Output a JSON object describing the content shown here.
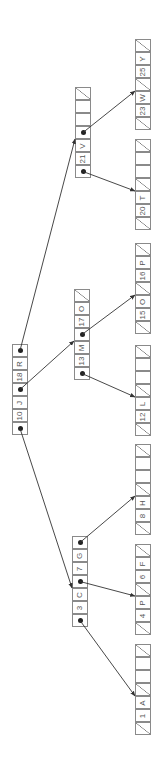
{
  "diagram": {
    "title": "",
    "type": "b-tree",
    "orientation": "rotated-90-ccw",
    "colors": {
      "line": "#8a8a8a",
      "text": "#555555",
      "arrow": "#333333"
    },
    "nodes": [
      {
        "id": "root",
        "x": 12,
        "y_bottom": 435,
        "cells": [
          {
            "kind": "ptr",
            "to": "n_left"
          },
          {
            "kind": "key",
            "text": "10"
          },
          {
            "kind": "key",
            "text": "J"
          },
          {
            "kind": "ptr",
            "to": "n_mid"
          },
          {
            "kind": "key",
            "text": "18"
          },
          {
            "kind": "key",
            "text": "R"
          },
          {
            "kind": "ptr",
            "to": "n_right"
          }
        ]
      },
      {
        "id": "n_left",
        "x": 72,
        "y_bottom": 627,
        "cells": [
          {
            "kind": "ptr",
            "to": "leaf1"
          },
          {
            "kind": "key",
            "text": "3"
          },
          {
            "kind": "key",
            "text": "C"
          },
          {
            "kind": "ptr",
            "to": "leaf2"
          },
          {
            "kind": "key",
            "text": "7"
          },
          {
            "kind": "key",
            "text": "G"
          },
          {
            "kind": "ptr",
            "to": "leaf3"
          }
        ]
      },
      {
        "id": "n_mid",
        "x": 74,
        "y_bottom": 380,
        "cells": [
          {
            "kind": "ptr",
            "to": "leaf4"
          },
          {
            "kind": "key",
            "text": "13"
          },
          {
            "kind": "key",
            "text": "M"
          },
          {
            "kind": "ptr",
            "to": "leaf5"
          },
          {
            "kind": "key",
            "text": "17"
          },
          {
            "kind": "key",
            "text": "O"
          },
          {
            "kind": "nil"
          }
        ]
      },
      {
        "id": "n_right",
        "x": 75,
        "y_bottom": 178,
        "cells": [
          {
            "kind": "ptr",
            "to": "leaf6"
          },
          {
            "kind": "key",
            "text": "21"
          },
          {
            "kind": "key",
            "text": "V"
          },
          {
            "kind": "ptr",
            "to": "leaf7"
          },
          {
            "kind": "empty"
          },
          {
            "kind": "empty"
          },
          {
            "kind": "nil"
          }
        ]
      },
      {
        "id": "leaf1",
        "x": 135,
        "y_bottom": 735,
        "cells": [
          {
            "kind": "nil"
          },
          {
            "kind": "key",
            "text": "1"
          },
          {
            "kind": "key",
            "text": "A"
          },
          {
            "kind": "nil"
          },
          {
            "kind": "empty"
          },
          {
            "kind": "empty"
          },
          {
            "kind": "nil"
          }
        ]
      },
      {
        "id": "leaf2",
        "x": 135,
        "y_bottom": 635,
        "cells": [
          {
            "kind": "nil"
          },
          {
            "kind": "key",
            "text": "4"
          },
          {
            "kind": "key",
            "text": "P"
          },
          {
            "kind": "nil"
          },
          {
            "kind": "key",
            "text": "6"
          },
          {
            "kind": "key",
            "text": "F"
          },
          {
            "kind": "nil"
          }
        ]
      },
      {
        "id": "leaf3",
        "x": 135,
        "y_bottom": 535,
        "cells": [
          {
            "kind": "nil"
          },
          {
            "kind": "key",
            "text": "8"
          },
          {
            "kind": "key",
            "text": "H"
          },
          {
            "kind": "nil"
          },
          {
            "kind": "empty"
          },
          {
            "kind": "empty"
          },
          {
            "kind": "nil"
          }
        ]
      },
      {
        "id": "leaf4",
        "x": 135,
        "y_bottom": 436,
        "cells": [
          {
            "kind": "nil"
          },
          {
            "kind": "key",
            "text": "12"
          },
          {
            "kind": "key",
            "text": "L"
          },
          {
            "kind": "nil"
          },
          {
            "kind": "empty"
          },
          {
            "kind": "empty"
          },
          {
            "kind": "nil"
          }
        ]
      },
      {
        "id": "leaf5",
        "x": 135,
        "y_bottom": 334,
        "cells": [
          {
            "kind": "nil"
          },
          {
            "kind": "key",
            "text": "15"
          },
          {
            "kind": "key",
            "text": "O"
          },
          {
            "kind": "nil"
          },
          {
            "kind": "key",
            "text": "16"
          },
          {
            "kind": "key",
            "text": "P"
          },
          {
            "kind": "nil"
          }
        ]
      },
      {
        "id": "leaf6",
        "x": 135,
        "y_bottom": 230,
        "cells": [
          {
            "kind": "nil"
          },
          {
            "kind": "key",
            "text": "20"
          },
          {
            "kind": "key",
            "text": "T"
          },
          {
            "kind": "nil"
          },
          {
            "kind": "empty"
          },
          {
            "kind": "empty"
          },
          {
            "kind": "nil"
          }
        ]
      },
      {
        "id": "leaf7",
        "x": 135,
        "y_bottom": 130,
        "cells": [
          {
            "kind": "nil"
          },
          {
            "kind": "key",
            "text": "23"
          },
          {
            "kind": "key",
            "text": "W"
          },
          {
            "kind": "nil"
          },
          {
            "kind": "key",
            "text": "25"
          },
          {
            "kind": "key",
            "text": "Y"
          },
          {
            "kind": "nil"
          }
        ]
      }
    ]
  }
}
